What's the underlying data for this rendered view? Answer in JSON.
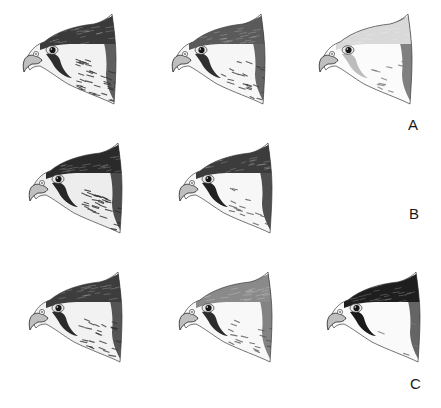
{
  "figure": {
    "rows": [
      {
        "label": "A",
        "heads": [
          {
            "variant": "streaked-dark-crown",
            "crown": "#3a3a3a",
            "moustache": "#2e2e2e",
            "nape": "#444444",
            "cheek": "#f2f2f2",
            "streak": "#333333",
            "streak_density": 0.8
          },
          {
            "variant": "streaked-medium-crown",
            "crown": "#5a5a5a",
            "moustache": "#303030",
            "nape": "#4c4c4c",
            "cheek": "#f6f6f6",
            "streak": "#3a3a3a",
            "streak_density": 0.6
          },
          {
            "variant": "pale-head",
            "crown": "#d9d9d9",
            "moustache": "#bdbdbd",
            "nape": "#6a6a6a",
            "cheek": "#fbfbfb",
            "streak": "#7a7a7a",
            "streak_density": 0.25
          }
        ]
      },
      {
        "label": "B",
        "heads": [
          {
            "variant": "dark-hooded-streaked",
            "crown": "#2a2a2a",
            "moustache": "#262626",
            "nape": "#2f2f2f",
            "cheek": "#ededed",
            "streak": "#2b2b2b",
            "streak_density": 0.75
          },
          {
            "variant": "dark-crown-pale-throat",
            "crown": "#3c3c3c",
            "moustache": "#222222",
            "nape": "#303030",
            "cheek": "#f7f7f7",
            "streak": "#555555",
            "streak_density": 0.35
          }
        ]
      },
      {
        "label": "C",
        "heads": [
          {
            "variant": "streaked-dark-nape",
            "crown": "#3d3d3d",
            "moustache": "#2a2a2a",
            "nape": "#3a3a3a",
            "cheek": "#f2f2f2",
            "streak": "#333333",
            "streak_density": 0.6
          },
          {
            "variant": "pale-crown-grey-nape",
            "crown": "#8a8a8a",
            "moustache": "#2c2c2c",
            "nape": "#6e6e6e",
            "cheek": "#f8f8f8",
            "streak": "#555555",
            "streak_density": 0.35
          },
          {
            "variant": "black-hooded",
            "crown": "#1e1e1e",
            "moustache": "#1a1a1a",
            "nape": "#4a4a4a",
            "cheek": "#fafafa",
            "streak": "#777777",
            "streak_density": 0.1
          }
        ]
      }
    ]
  }
}
